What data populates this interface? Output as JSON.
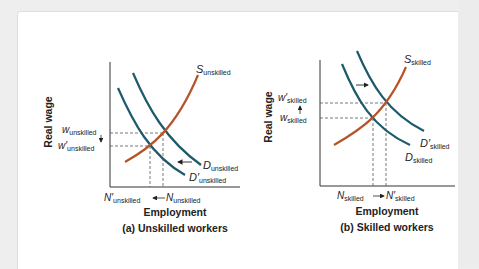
{
  "panels": [
    {
      "id": "a",
      "caption": "(a) Unskilled workers",
      "xlabel": "Employment",
      "ylabel": "Real wage",
      "supply_label": {
        "main": "S",
        "sub": "unskilled"
      },
      "demand_label": {
        "main": "D",
        "sub": "unskilled"
      },
      "demand_prime_label": {
        "main": "D′",
        "sub": "unskilled"
      },
      "wage_label": {
        "main": "w",
        "sub": "unskilled"
      },
      "wage_prime_label": {
        "main": "w′",
        "sub": "unskilled"
      },
      "emp_label": {
        "main": "N",
        "sub": "unskilled"
      },
      "emp_prime_label": {
        "main": "N′",
        "sub": "unskilled"
      },
      "shift": "left"
    },
    {
      "id": "b",
      "caption": "(b) Skilled workers",
      "xlabel": "Employment",
      "ylabel": "Real wage",
      "supply_label": {
        "main": "S",
        "sub": "skilled"
      },
      "demand_label": {
        "main": "D",
        "sub": "skilled"
      },
      "demand_prime_label": {
        "main": "D′",
        "sub": "skilled"
      },
      "wage_label": {
        "main": "w",
        "sub": "skilled"
      },
      "wage_prime_label": {
        "main": "w′",
        "sub": "skilled"
      },
      "emp_label": {
        "main": "N",
        "sub": "skilled"
      },
      "emp_prime_label": {
        "main": "N′",
        "sub": "skilled"
      },
      "shift": "right"
    }
  ],
  "colors": {
    "supply": "#b5532a",
    "demand": "#1d5a6b",
    "axis": "#333333",
    "dashed": "#555555"
  }
}
